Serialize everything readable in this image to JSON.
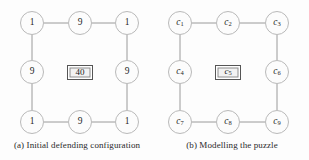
{
  "figure": {
    "width": 309,
    "height": 160,
    "background": "#fdfdfd",
    "node_stroke": "#b9b9b9",
    "node_fill": "#fcfcfc",
    "edge_color": "#9a9a9a",
    "box_border": "#555555",
    "box_fill": "#f2f2f2",
    "text_color": "#1f1f1f"
  },
  "panels": [
    {
      "id": "a",
      "caption": "(a) Initial defending configuration",
      "nodes": [
        {
          "id": "n1",
          "label": "1",
          "sub": "",
          "x": 32,
          "y": 23,
          "italic": false
        },
        {
          "id": "n2",
          "label": "9",
          "sub": "",
          "x": 80,
          "y": 23,
          "italic": false
        },
        {
          "id": "n3",
          "label": "1",
          "sub": "",
          "x": 127,
          "y": 23,
          "italic": false
        },
        {
          "id": "n4",
          "label": "9",
          "sub": "",
          "x": 32,
          "y": 72,
          "italic": false
        },
        {
          "id": "n6",
          "label": "9",
          "sub": "",
          "x": 127,
          "y": 72,
          "italic": false
        },
        {
          "id": "n7",
          "label": "1",
          "sub": "",
          "x": 32,
          "y": 122,
          "italic": false
        },
        {
          "id": "n8",
          "label": "9",
          "sub": "",
          "x": 80,
          "y": 122,
          "italic": false
        },
        {
          "id": "n9",
          "label": "1",
          "sub": "",
          "x": 127,
          "y": 122,
          "italic": false
        }
      ],
      "center": {
        "label": "40",
        "sub": "",
        "x": 80,
        "y": 72,
        "italic": false
      },
      "edges": [
        {
          "from": "n1",
          "to": "n2"
        },
        {
          "from": "n2",
          "to": "n3"
        },
        {
          "from": "n1",
          "to": "n4"
        },
        {
          "from": "n4",
          "to": "n7"
        },
        {
          "from": "n3",
          "to": "n6"
        },
        {
          "from": "n6",
          "to": "n9"
        },
        {
          "from": "n7",
          "to": "n8"
        },
        {
          "from": "n8",
          "to": "n9"
        }
      ]
    },
    {
      "id": "b",
      "caption": "(b) Modelling the puzzle",
      "nodes": [
        {
          "id": "n1",
          "label": "c",
          "sub": "1",
          "x": 25,
          "y": 23,
          "italic": true
        },
        {
          "id": "n2",
          "label": "c",
          "sub": "2",
          "x": 73,
          "y": 23,
          "italic": true
        },
        {
          "id": "n3",
          "label": "c",
          "sub": "3",
          "x": 122,
          "y": 23,
          "italic": true
        },
        {
          "id": "n4",
          "label": "c",
          "sub": "4",
          "x": 25,
          "y": 72,
          "italic": true
        },
        {
          "id": "n6",
          "label": "c",
          "sub": "6",
          "x": 122,
          "y": 72,
          "italic": true
        },
        {
          "id": "n7",
          "label": "c",
          "sub": "7",
          "x": 25,
          "y": 122,
          "italic": true
        },
        {
          "id": "n8",
          "label": "c",
          "sub": "8",
          "x": 73,
          "y": 122,
          "italic": true
        },
        {
          "id": "n9",
          "label": "c",
          "sub": "9",
          "x": 122,
          "y": 122,
          "italic": true
        }
      ],
      "center": {
        "label": "c",
        "sub": "5",
        "x": 73,
        "y": 72,
        "italic": true
      },
      "edges": [
        {
          "from": "n1",
          "to": "n2"
        },
        {
          "from": "n2",
          "to": "n3"
        },
        {
          "from": "n1",
          "to": "n4"
        },
        {
          "from": "n4",
          "to": "n7"
        },
        {
          "from": "n3",
          "to": "n6"
        },
        {
          "from": "n6",
          "to": "n9"
        },
        {
          "from": "n7",
          "to": "n8"
        },
        {
          "from": "n8",
          "to": "n9"
        }
      ]
    }
  ]
}
